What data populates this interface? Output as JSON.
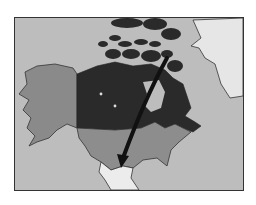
{
  "map": {
    "subject": "North America",
    "colors": {
      "ocean": "#bdbdbd",
      "canada": "#2a2a2a",
      "alaska": "#8a8a8a",
      "usa": "#8d8d8d",
      "greenland": "#e6e6e6",
      "mexico": "#ececec",
      "arrow": "#111111",
      "border": "#333333"
    },
    "regions": [
      "Alaska",
      "Canada",
      "Canadian Arctic Islands",
      "Greenland",
      "United States",
      "Mexico"
    ],
    "arrow": {
      "from": "Canadian Arctic",
      "to": "Southern United States"
    }
  }
}
